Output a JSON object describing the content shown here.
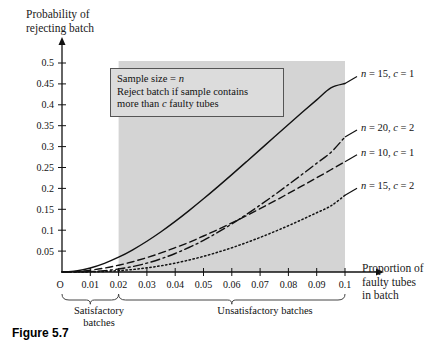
{
  "figure": {
    "caption": "Figure 5.7"
  },
  "axes": {
    "y_title": "Probability of\nrejecting batch",
    "x_title": "Proportion of\nfaulty tubes\nin batch",
    "origin_label": "O",
    "y_ticks": [
      "0.05",
      "0.1",
      "0.15",
      "0.2",
      "0.25",
      "0.3",
      "0.35",
      "0.4",
      "0.45",
      "0.5"
    ],
    "x_ticks": [
      "0.01",
      "0.02",
      "0.03",
      "0.04",
      "0.05",
      "0.06",
      "0.07",
      "0.08",
      "0.09",
      "0.1"
    ]
  },
  "annotation": {
    "line1_pre": "Sample size = ",
    "line1_var": "n",
    "line2": "Reject batch if sample contains",
    "line3_pre": "more than ",
    "line3_var": "c",
    "line3_post": " faulty tubes"
  },
  "regions": {
    "satisfactory_label": "Satisfactory\nbatches",
    "unsatisfactory_label": "Unsatisfactory batches",
    "shade_color": "#d4d4d4",
    "shade_from": 0.02,
    "shade_to": 0.1
  },
  "chart_data": {
    "type": "line",
    "title": "",
    "xlabel": "Proportion of faulty tubes in batch",
    "ylabel": "Probability of rejecting batch",
    "xlim": [
      0,
      0.1
    ],
    "ylim": [
      0,
      0.5
    ],
    "grid": false,
    "legend_position": "right-inline",
    "x": [
      0,
      0.005,
      0.01,
      0.015,
      0.02,
      0.025,
      0.03,
      0.035,
      0.04,
      0.045,
      0.05,
      0.055,
      0.06,
      0.065,
      0.07,
      0.075,
      0.08,
      0.085,
      0.09,
      0.095,
      0.1
    ],
    "series": [
      {
        "name": "n = 15, c = 1",
        "label": "n = 15, c = 1",
        "n": 15,
        "c": 1,
        "style": "solid",
        "values": [
          0,
          0.0026,
          0.0096,
          0.0207,
          0.0353,
          0.0531,
          0.0736,
          0.0964,
          0.1211,
          0.1475,
          0.1751,
          0.2037,
          0.233,
          0.2628,
          0.2928,
          0.3229,
          0.3529,
          0.3826,
          0.4118,
          0.4405,
          0.451
        ]
      },
      {
        "name": "n = 20, c = 2",
        "label": "n = 20, c = 2",
        "n": 20,
        "c": 2,
        "style": "dashdot",
        "values": [
          0,
          0.0001,
          0.001,
          0.0032,
          0.0071,
          0.0131,
          0.0212,
          0.0316,
          0.0443,
          0.0592,
          0.0755,
          0.0946,
          0.115,
          0.1369,
          0.16,
          0.1841,
          0.2089,
          0.2343,
          0.2601,
          0.2861,
          0.3231
        ]
      },
      {
        "name": "n = 10, c = 1",
        "label": "n = 10, c = 1",
        "n": 10,
        "c": 1,
        "style": "dashed",
        "values": [
          0,
          0.0011,
          0.0043,
          0.0094,
          0.0162,
          0.0246,
          0.0345,
          0.0456,
          0.0582,
          0.0713,
          0.0861,
          0.1012,
          0.1176,
          0.134,
          0.1517,
          0.1694,
          0.1879,
          0.2065,
          0.2254,
          0.2446,
          0.2639
        ]
      },
      {
        "name": "n = 15, c = 2",
        "label": "n = 15, c = 2",
        "n": 15,
        "c": 2,
        "style": "dotted",
        "values": [
          0,
          2e-05,
          0.0004,
          0.0014,
          0.0032,
          0.006,
          0.0099,
          0.015,
          0.0213,
          0.0288,
          0.0374,
          0.0472,
          0.058,
          0.0699,
          0.0827,
          0.0964,
          0.1108,
          0.126,
          0.1418,
          0.1581,
          0.1835
        ]
      }
    ]
  }
}
